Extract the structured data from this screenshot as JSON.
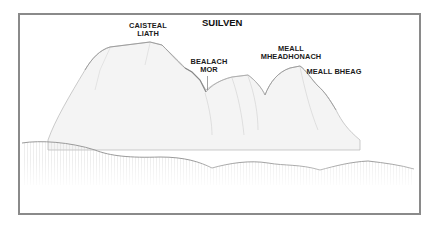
{
  "diagram": {
    "title": "SUILVEN",
    "labels": [
      {
        "id": "caisteal-liath",
        "line1": "CAISTEAL",
        "line2": "LIATH"
      },
      {
        "id": "bealach-mor",
        "line1": "BEALACH",
        "line2": "MOR"
      },
      {
        "id": "meall-mheadhonach",
        "line1": "MEALL",
        "line2": "MHEADHONACH"
      },
      {
        "id": "meall-bheag",
        "line1": "MEALL BHEAG",
        "line2": ""
      }
    ],
    "colors": {
      "frame": "#8a8a8a",
      "ink": "#1a1a1a",
      "hatch": "#b8b8b8"
    }
  }
}
